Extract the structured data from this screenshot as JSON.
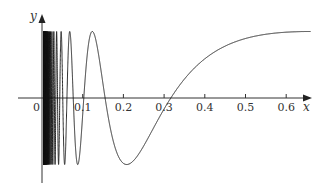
{
  "chart_data": {
    "type": "line",
    "title": "",
    "xlabel": "x",
    "ylabel": "y",
    "function": "approximately y = sin(0.955/x + 0.124), an oscillation accumulating near x = 0",
    "params": {
      "a": 0.955,
      "b": 0.124
    },
    "xlim": [
      0,
      0.66
    ],
    "ylim": [
      -1,
      1
    ],
    "x_ticks": [
      0.1,
      0.2,
      0.3,
      0.4,
      0.5,
      0.6
    ],
    "x_tick_labels": [
      "0",
      "0.1",
      "0.2",
      "0.3",
      "0.4",
      "0.5",
      "0.6"
    ],
    "grid": false,
    "legend": null,
    "key_points": [
      {
        "x": 0.1,
        "y": 0,
        "note": "zero crossing"
      },
      {
        "x": 0.126,
        "y": 1,
        "note": "local max"
      },
      {
        "x": 0.155,
        "y": 0,
        "note": "zero crossing"
      },
      {
        "x": 0.21,
        "y": -1,
        "note": "local min"
      },
      {
        "x": 0.316,
        "y": 0,
        "note": "zero crossing"
      },
      {
        "x": 0.65,
        "y": 1,
        "note": "approaches 1"
      }
    ]
  },
  "axes": {
    "x_label": "x",
    "y_label": "y",
    "origin_label": "0",
    "ticks": [
      {
        "label": "0.1",
        "value": 0.1
      },
      {
        "label": "0.2",
        "value": 0.2
      },
      {
        "label": "0.3",
        "value": 0.3
      },
      {
        "label": "0.4",
        "value": 0.4
      },
      {
        "label": "0.5",
        "value": 0.5
      },
      {
        "label": "0.6",
        "value": 0.6
      }
    ]
  }
}
